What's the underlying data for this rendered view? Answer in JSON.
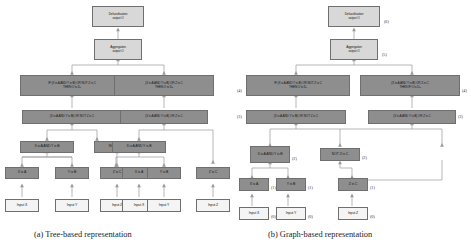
{
  "figure": {
    "captions": {
      "a": "(a) Tree-based representation",
      "b": "(b) Graph-based representation"
    }
  },
  "labels": {
    "defuzzification": "Defuzzification\noutput O",
    "defuzzification_line1": "Defuzzification",
    "defuzzification_line2": "output O",
    "aggregation_line1": "Aggregation",
    "aggregation_line2": "output O",
    "rule1_line1": "IF (X is A AND Y is B) OR NOT Z is C",
    "rule1_line2": "THEN O is D",
    "rule1_sub": "1",
    "rule2_line1": "(X is A AND Y is B) OR Z is C",
    "rule2_line2": "THEN IF O is D",
    "rule2_sub": "2",
    "rule2_line2_tree": "THEN O is D",
    "expr_or_not": "(X is A AND Y is B) OR NOT Z is C",
    "expr_or": "(X is A AND Y is B) OR Z is C",
    "and_xy": "X is A AND Y is B",
    "not_z": "NOT Z is C",
    "x_is_a": "X is A",
    "y_is_b": "Y is B",
    "z_is_c": "Z is C",
    "input_x": "Input X",
    "input_y": "Input Y",
    "input_z": "Input Z"
  },
  "depth_tags": {
    "l0": "(0)",
    "l1": "(1)",
    "l2": "(2)",
    "l3": "(3)",
    "l4": "(4)",
    "l5": "(5)",
    "l6": "(6)"
  },
  "colors": {
    "node_light": "#d8d8d8",
    "node_dark": "#8e8e8e",
    "node_white": "#f4f4f4",
    "edge": "#9a9a9a",
    "border": "#6f6f6f",
    "background": "#ffffff"
  },
  "tree": {
    "nodes": [
      {
        "id": "defuzz",
        "label_keys": [
          "defuzzification_line1",
          "defuzzification_line2"
        ],
        "style": "light"
      },
      {
        "id": "aggr",
        "label_keys": [
          "aggregation_line1",
          "aggregation_line2"
        ],
        "style": "light"
      },
      {
        "id": "rule1",
        "label_keys": [
          "rule1_line1",
          "rule1_line2"
        ],
        "style": "dark"
      },
      {
        "id": "rule2",
        "label_keys": [
          "rule2_line1",
          "rule2_line2_tree"
        ],
        "style": "dark"
      },
      {
        "id": "expr1",
        "label_keys": [
          "expr_or_not"
        ],
        "style": "dark"
      },
      {
        "id": "expr2",
        "label_keys": [
          "expr_or"
        ],
        "style": "dark"
      },
      {
        "id": "and1",
        "label_keys": [
          "and_xy"
        ],
        "style": "dark"
      },
      {
        "id": "not1",
        "label_keys": [
          "not_z"
        ],
        "style": "dark"
      },
      {
        "id": "and2",
        "label_keys": [
          "and_xy"
        ],
        "style": "dark"
      },
      {
        "id": "xa1",
        "label_keys": [
          "x_is_a"
        ],
        "style": "dark"
      },
      {
        "id": "yb1",
        "label_keys": [
          "y_is_b"
        ],
        "style": "dark"
      },
      {
        "id": "zc1",
        "label_keys": [
          "z_is_c"
        ],
        "style": "dark"
      },
      {
        "id": "xa2",
        "label_keys": [
          "x_is_a"
        ],
        "style": "dark"
      },
      {
        "id": "yb2",
        "label_keys": [
          "y_is_b"
        ],
        "style": "dark"
      },
      {
        "id": "zc2",
        "label_keys": [
          "z_is_c"
        ],
        "style": "dark"
      },
      {
        "id": "inx1",
        "label_keys": [
          "input_x"
        ],
        "style": "white"
      },
      {
        "id": "iny1",
        "label_keys": [
          "input_y"
        ],
        "style": "white"
      },
      {
        "id": "inz1",
        "label_keys": [
          "input_z"
        ],
        "style": "white"
      },
      {
        "id": "inx2",
        "label_keys": [
          "input_x"
        ],
        "style": "white"
      },
      {
        "id": "iny2",
        "label_keys": [
          "input_y"
        ],
        "style": "white"
      },
      {
        "id": "inz2",
        "label_keys": [
          "input_z"
        ],
        "style": "white"
      }
    ]
  },
  "graph": {
    "nodes": [
      {
        "id": "g-defuzz",
        "tag": "(6)"
      },
      {
        "id": "g-aggr",
        "tag": "(5)"
      },
      {
        "id": "g-rule1",
        "tag": "(4)"
      },
      {
        "id": "g-rule2",
        "tag": "(4)"
      },
      {
        "id": "g-expr1",
        "tag": "(3)"
      },
      {
        "id": "g-expr2",
        "tag": "(3)"
      },
      {
        "id": "g-and",
        "tag": "(2)"
      },
      {
        "id": "g-not",
        "tag": "(2)"
      },
      {
        "id": "g-xa",
        "tag": "(1)"
      },
      {
        "id": "g-yb",
        "tag": "(1)"
      },
      {
        "id": "g-zc",
        "tag": "(1)"
      },
      {
        "id": "g-inx",
        "tag": "(0)"
      },
      {
        "id": "g-iny",
        "tag": "(0)"
      },
      {
        "id": "g-inz",
        "tag": "(0)"
      }
    ]
  }
}
